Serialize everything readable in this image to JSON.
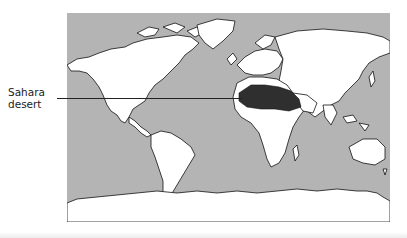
{
  "map": {
    "title": "",
    "ocean_color": "#b4b4b4",
    "land_color": "#ffffff",
    "highlight_color": "#2f2f2f",
    "highlighted_region": "Sahara desert"
  },
  "annotation": {
    "line1": "Sahara",
    "line2": "desert"
  }
}
